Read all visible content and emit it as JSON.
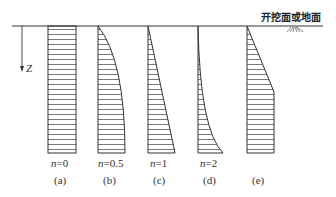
{
  "diagram": {
    "ground_label": "开挖面或地面",
    "axis_label": "Z",
    "colors": {
      "line": "#333333",
      "hatch": "#555555"
    },
    "panels": [
      {
        "id": "a",
        "n_var": "n",
        "n_value": "=0",
        "caption": "(a)",
        "shape": "rectangle"
      },
      {
        "id": "b",
        "n_var": "n",
        "n_value": "=0.5",
        "caption": "(b)",
        "shape": "convex-curve"
      },
      {
        "id": "c",
        "n_var": "n",
        "n_value": "=1",
        "caption": "(c)",
        "shape": "triangle"
      },
      {
        "id": "d",
        "n_var": "n",
        "n_value": "=2",
        "caption": "(d)",
        "shape": "concave-curve"
      },
      {
        "id": "e",
        "n_var": "",
        "n_value": "",
        "caption": "(e)",
        "shape": "trapezoid-then-rectangle"
      }
    ]
  }
}
